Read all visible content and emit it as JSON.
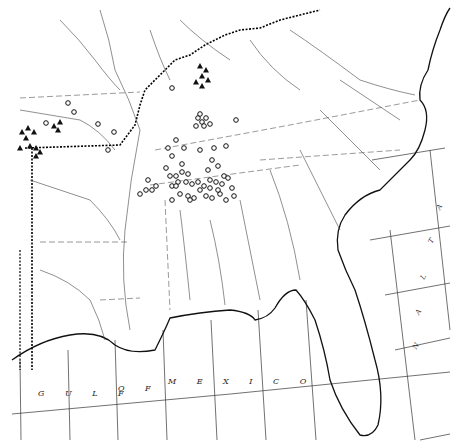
{
  "map": {
    "labels": {
      "gulf": "G U L F",
      "of": "O F",
      "mexico": "M E X I C O",
      "atlantic_letters": [
        "A",
        "T",
        "L",
        "A",
        "N"
      ]
    },
    "colors": {
      "ink": "#222222",
      "background": "#ffffff"
    },
    "legend_symbols": {
      "circle": "open-circle-locality",
      "triangle": "filled-triangle-locality"
    },
    "circles": [
      [
        68,
        103
      ],
      [
        74,
        112
      ],
      [
        46,
        123
      ],
      [
        98,
        124
      ],
      [
        114,
        132
      ],
      [
        108,
        150
      ],
      [
        172,
        88
      ],
      [
        198,
        118
      ],
      [
        202,
        122
      ],
      [
        206,
        118
      ],
      [
        204,
        126
      ],
      [
        196,
        126
      ],
      [
        210,
        124
      ],
      [
        200,
        114
      ],
      [
        236,
        120
      ],
      [
        176,
        140
      ],
      [
        184,
        148
      ],
      [
        168,
        148
      ],
      [
        172,
        156
      ],
      [
        182,
        164
      ],
      [
        166,
        168
      ],
      [
        170,
        176
      ],
      [
        176,
        176
      ],
      [
        182,
        172
      ],
      [
        188,
        174
      ],
      [
        178,
        182
      ],
      [
        172,
        186
      ],
      [
        200,
        150
      ],
      [
        214,
        148
      ],
      [
        226,
        146
      ],
      [
        212,
        160
      ],
      [
        208,
        170
      ],
      [
        218,
        166
      ],
      [
        210,
        180
      ],
      [
        224,
        176
      ],
      [
        176,
        186
      ],
      [
        186,
        182
      ],
      [
        192,
        184
      ],
      [
        198,
        182
      ],
      [
        204,
        186
      ],
      [
        210,
        188
      ],
      [
        216,
        182
      ],
      [
        222,
        184
      ],
      [
        228,
        178
      ],
      [
        232,
        188
      ],
      [
        220,
        194
      ],
      [
        226,
        200
      ],
      [
        188,
        196
      ],
      [
        194,
        198
      ],
      [
        200,
        190
      ],
      [
        206,
        196
      ],
      [
        212,
        198
      ],
      [
        218,
        190
      ],
      [
        172,
        200
      ],
      [
        180,
        194
      ],
      [
        190,
        200
      ],
      [
        234,
        196
      ],
      [
        140,
        194
      ],
      [
        146,
        190
      ],
      [
        148,
        180
      ],
      [
        152,
        190
      ],
      [
        156,
        186
      ]
    ],
    "triangles": [
      [
        200,
        66
      ],
      [
        206,
        70
      ],
      [
        202,
        76
      ],
      [
        208,
        80
      ],
      [
        196,
        82
      ],
      [
        202,
        86
      ],
      [
        22,
        132
      ],
      [
        28,
        128
      ],
      [
        34,
        132
      ],
      [
        26,
        138
      ],
      [
        30,
        146
      ],
      [
        36,
        148
      ],
      [
        40,
        152
      ],
      [
        20,
        148
      ],
      [
        36,
        156
      ],
      [
        54,
        126
      ],
      [
        60,
        122
      ],
      [
        58,
        130
      ]
    ]
  }
}
